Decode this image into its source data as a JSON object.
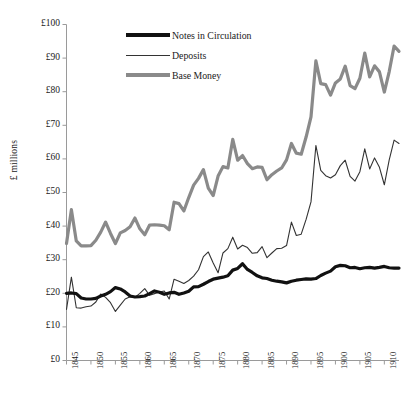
{
  "chart_data": {
    "type": "line",
    "title": "",
    "xlabel": "",
    "ylabel": "£ millions",
    "ylim": [
      0,
      100
    ],
    "xlim": [
      1845,
      1913
    ],
    "grid": false,
    "legend_position": "top-center",
    "ytick_labels": [
      "£100",
      "£90",
      "£80",
      "£70",
      "£60",
      "£50",
      "£40",
      "£30",
      "£20",
      "£10",
      "£0"
    ],
    "ytick_values": [
      100,
      90,
      80,
      70,
      60,
      50,
      40,
      30,
      20,
      10,
      0
    ],
    "xtick_labels": [
      "1845",
      "1850",
      "1855",
      "1860",
      "1865",
      "1870",
      "1875",
      "1880",
      "1885",
      "1890",
      "1895",
      "1900",
      "1905",
      "1910"
    ],
    "xtick_values": [
      1845,
      1850,
      1855,
      1860,
      1865,
      1870,
      1875,
      1880,
      1885,
      1890,
      1895,
      1900,
      1905,
      1910
    ],
    "x": [
      1845,
      1846,
      1847,
      1848,
      1849,
      1850,
      1851,
      1852,
      1853,
      1854,
      1855,
      1856,
      1857,
      1858,
      1859,
      1860,
      1861,
      1862,
      1863,
      1864,
      1865,
      1866,
      1867,
      1868,
      1869,
      1870,
      1871,
      1872,
      1873,
      1874,
      1875,
      1876,
      1877,
      1878,
      1879,
      1880,
      1881,
      1882,
      1883,
      1884,
      1885,
      1886,
      1887,
      1888,
      1889,
      1890,
      1891,
      1892,
      1893,
      1894,
      1895,
      1896,
      1897,
      1898,
      1899,
      1900,
      1901,
      1902,
      1903,
      1904,
      1905,
      1906,
      1907,
      1908,
      1909,
      1910,
      1911,
      1912,
      1913
    ],
    "series": [
      {
        "name": "Notes in Circulation",
        "color": "#111111",
        "width": 3.2,
        "values": [
          20.0,
          20.1,
          19.9,
          18.6,
          18.3,
          18.3,
          18.5,
          19.2,
          19.7,
          20.5,
          21.7,
          21.3,
          20.4,
          19.2,
          18.9,
          19.0,
          19.2,
          19.9,
          20.7,
          20.3,
          19.7,
          20.1,
          20.3,
          19.7,
          20.1,
          20.6,
          21.9,
          22.0,
          22.7,
          23.5,
          24.2,
          24.5,
          24.8,
          25.2,
          26.9,
          27.4,
          28.8,
          27.1,
          26.2,
          25.2,
          24.6,
          24.4,
          23.9,
          23.6,
          23.4,
          23.1,
          23.6,
          23.9,
          24.1,
          24.3,
          24.2,
          24.4,
          25.3,
          26.0,
          26.6,
          27.9,
          28.3,
          28.2,
          27.6,
          27.7,
          27.3,
          27.6,
          27.7,
          27.5,
          27.7,
          28.0,
          27.6,
          27.5,
          27.5
        ]
      },
      {
        "name": "Deposits",
        "color": "#333333",
        "width": 1.1,
        "values": [
          15.2,
          24.8,
          15.7,
          15.6,
          16.0,
          16.2,
          17.4,
          19.8,
          18.8,
          17.2,
          14.6,
          16.5,
          18.3,
          19.0,
          18.8,
          20.0,
          21.4,
          19.4,
          19.9,
          20.4,
          20.7,
          18.3,
          24.2,
          23.6,
          22.9,
          23.8,
          25.1,
          27.0,
          30.9,
          32.3,
          29.0,
          26.1,
          32.0,
          33.3,
          36.7,
          33.2,
          34.3,
          33.6,
          31.9,
          32.1,
          33.9,
          30.6,
          32.0,
          33.3,
          33.4,
          34.2,
          41.2,
          37.2,
          37.6,
          42.0,
          47.2,
          64.0,
          56.6,
          55.0,
          54.3,
          55.3,
          58.0,
          59.6,
          54.8,
          53.4,
          56.2,
          63.0,
          57.0,
          60.3,
          57.5,
          52.3,
          59.7,
          65.6,
          64.6
        ]
      },
      {
        "name": "Base Money",
        "color": "#8a8a8a",
        "width": 3.2,
        "values": [
          34.8,
          44.9,
          35.6,
          34.1,
          34.1,
          34.2,
          35.8,
          38.2,
          41.2,
          37.8,
          34.8,
          38.0,
          38.7,
          39.8,
          42.4,
          39.2,
          37.4,
          40.3,
          40.4,
          40.3,
          40.1,
          38.9,
          47.1,
          46.7,
          44.5,
          48.5,
          52.2,
          54.2,
          56.8,
          51.3,
          49.1,
          54.9,
          57.7,
          57.3,
          65.8,
          59.6,
          61.0,
          58.6,
          57.1,
          57.6,
          57.5,
          53.8,
          55.3,
          56.4,
          57.3,
          59.7,
          64.6,
          61.7,
          61.4,
          66.5,
          72.5,
          89.2,
          82.4,
          82.1,
          79.0,
          82.6,
          83.8,
          87.6,
          81.8,
          80.9,
          84.0,
          91.5,
          84.4,
          87.7,
          85.9,
          79.9,
          86.0,
          93.6,
          92.0
        ]
      }
    ]
  }
}
